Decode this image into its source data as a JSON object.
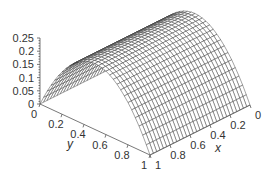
{
  "chart_data": {
    "type": "surface3d",
    "title": "",
    "xlabel": "x",
    "ylabel": "y",
    "zlabel": "",
    "x_ticks": [
      "0",
      "0.2",
      "0.4",
      "0.6",
      "0.8",
      "1"
    ],
    "y_ticks": [
      "0",
      "0.2",
      "0.4",
      "0.6",
      "0.8",
      "1"
    ],
    "z_ticks": [
      "0",
      "0.05",
      "0.1",
      "0.15",
      "0.2",
      "0.25"
    ],
    "xlim": [
      0,
      1
    ],
    "ylim": [
      0,
      1
    ],
    "zlim": [
      0,
      0.25
    ],
    "function": "z = y(1 - y)",
    "grid_resolution": 30,
    "peak": {
      "y": 0.5,
      "z": 0.25
    },
    "style": {
      "wire_color": "#333333",
      "fill_color": "#ffffff",
      "axis_color": "#555555"
    }
  }
}
